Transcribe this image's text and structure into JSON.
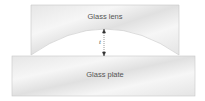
{
  "diagram": {
    "lens_label": "Glass lens",
    "plate_label": "Glass plate",
    "gap_label": "t",
    "colors": {
      "glass_light": "#f4f4f4",
      "glass_mid": "#e2e2e2",
      "border": "#c4c4c4",
      "text": "#555555"
    }
  }
}
